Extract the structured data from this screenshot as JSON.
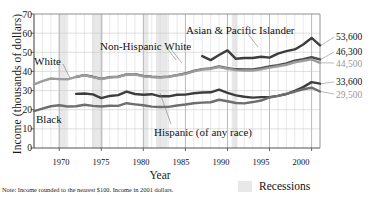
{
  "chart_data": {
    "type": "line",
    "title": "",
    "xlabel": "Year",
    "ylabel": "Income (thousands of dollars)",
    "xlim": [
      1967,
      2001
    ],
    "ylim": [
      0,
      70
    ],
    "yticks": [
      0,
      10,
      20,
      30,
      40,
      50,
      60,
      70
    ],
    "xticks": [
      1970,
      1975,
      1980,
      1985,
      1990,
      1995,
      2000
    ],
    "grid": "vertical-yearly-and-horizontal",
    "legend_position": "inline-annotations",
    "note": "Note: Income rounded to the nearest $100. Income in 2001 dollars.",
    "recession_legend_label": "Recessions",
    "recession_bands": [
      [
        1969.9,
        1970.9
      ],
      [
        1973.9,
        1975.2
      ],
      [
        1980.0,
        1980.6
      ],
      [
        1981.5,
        1982.9
      ],
      [
        1990.5,
        1991.2
      ],
      [
        2001.2,
        2001.9
      ]
    ],
    "series": [
      {
        "name": "Asian & Pacific Islander",
        "color": "#3d3d3d",
        "width": 2.4,
        "end_value_label": "53,600",
        "end_value": 53.6,
        "x": [
          1987,
          1988,
          1989,
          1990,
          1991,
          1992,
          1993,
          1994,
          1995,
          1996,
          1997,
          1998,
          1999,
          2000,
          2001
        ],
        "y": [
          48.0,
          45.9,
          48.6,
          51.0,
          46.6,
          47.0,
          47.0,
          47.7,
          47.2,
          49.3,
          50.6,
          51.5,
          54.1,
          57.5,
          53.6
        ]
      },
      {
        "name": "Non-Hispanic White",
        "color": "#4a4a4a",
        "width": 2.4,
        "end_value_label": "46,300",
        "end_value": 46.3,
        "x": [
          1972,
          1973,
          1974,
          1975,
          1976,
          1977,
          1978,
          1979,
          1980,
          1981,
          1982,
          1983,
          1984,
          1985,
          1986,
          1987,
          1988,
          1989,
          1990,
          1991,
          1992,
          1993,
          1994,
          1995,
          1996,
          1997,
          1998,
          1999,
          2000,
          2001
        ],
        "y": [
          37.1,
          38.1,
          37.2,
          36.1,
          37.0,
          37.3,
          38.4,
          38.6,
          37.6,
          37.2,
          37.0,
          37.3,
          38.1,
          38.9,
          40.3,
          41.2,
          41.6,
          42.6,
          41.7,
          41.1,
          41.0,
          41.0,
          41.7,
          42.6,
          43.3,
          44.2,
          45.6,
          46.4,
          47.4,
          46.3
        ]
      },
      {
        "name": "White",
        "color": "#9c9c9c",
        "width": 2.4,
        "end_value_label": "44,500",
        "end_value": 44.5,
        "x": [
          1967,
          1968,
          1969,
          1970,
          1971,
          1972,
          1973,
          1974,
          1975,
          1976,
          1977,
          1978,
          1979,
          1980,
          1981,
          1982,
          1983,
          1984,
          1985,
          1986,
          1987,
          1988,
          1989,
          1990,
          1991,
          1992,
          1993,
          1994,
          1995,
          1996,
          1997,
          1998,
          1999,
          2000,
          2001
        ],
        "y": [
          33.2,
          34.9,
          36.3,
          36.0,
          35.9,
          37.2,
          38.0,
          37.0,
          36.0,
          36.8,
          37.1,
          38.4,
          38.5,
          37.5,
          37.1,
          36.8,
          37.2,
          38.0,
          38.7,
          40.0,
          41.0,
          41.3,
          42.3,
          41.4,
          40.7,
          40.5,
          40.5,
          41.1,
          42.0,
          42.7,
          43.5,
          44.8,
          45.6,
          46.3,
          44.5
        ]
      },
      {
        "name": "Hispanic (of any race)",
        "color": "#3d3d3d",
        "width": 2.4,
        "end_value_label": "33,600",
        "end_value": 33.6,
        "x": [
          1972,
          1973,
          1974,
          1975,
          1976,
          1977,
          1978,
          1979,
          1980,
          1981,
          1982,
          1983,
          1984,
          1985,
          1986,
          1987,
          1988,
          1989,
          1990,
          1991,
          1992,
          1993,
          1994,
          1995,
          1996,
          1997,
          1998,
          1999,
          2000,
          2001
        ],
        "y": [
          28.3,
          28.5,
          28.0,
          26.1,
          27.2,
          27.6,
          29.5,
          28.2,
          27.8,
          28.1,
          27.0,
          27.0,
          27.8,
          27.9,
          28.6,
          29.0,
          29.1,
          30.5,
          28.8,
          27.5,
          26.8,
          26.3,
          26.6,
          26.6,
          27.2,
          28.2,
          29.8,
          31.8,
          34.4,
          33.6
        ]
      },
      {
        "name": "Black",
        "color": "#6e6e6e",
        "width": 2.4,
        "end_value_label": "29,500",
        "end_value": 29.5,
        "x": [
          1967,
          1968,
          1969,
          1970,
          1971,
          1972,
          1973,
          1974,
          1975,
          1976,
          1977,
          1978,
          1979,
          1980,
          1981,
          1982,
          1983,
          1984,
          1985,
          1986,
          1987,
          1988,
          1989,
          1990,
          1991,
          1992,
          1993,
          1994,
          1995,
          1996,
          1997,
          1998,
          1999,
          2000,
          2001
        ],
        "y": [
          19.3,
          20.6,
          21.8,
          22.3,
          21.7,
          21.8,
          22.6,
          22.0,
          21.7,
          22.1,
          22.0,
          23.4,
          22.8,
          22.3,
          21.6,
          21.4,
          21.5,
          22.2,
          22.7,
          23.4,
          23.7,
          23.9,
          25.2,
          24.4,
          23.5,
          23.3,
          24.0,
          24.8,
          26.4,
          27.2,
          28.3,
          29.4,
          30.7,
          31.5,
          29.5
        ]
      }
    ],
    "annotations": [
      {
        "text": "White",
        "role": "series-label"
      },
      {
        "text": "Black",
        "role": "series-label"
      },
      {
        "text": "Non-Hispanic White",
        "role": "series-label"
      },
      {
        "text": "Asian & Pacific Islander",
        "role": "series-label"
      },
      {
        "text": "Hispanic (of any race)",
        "role": "series-label"
      }
    ]
  },
  "axis": {
    "y_title": "Income (thousands of dollars)",
    "x_title": "Year",
    "yticks": [
      "70",
      "60",
      "50",
      "40",
      "30",
      "20",
      "10",
      "0"
    ],
    "xticks": [
      "1970",
      "1975",
      "1980",
      "1985",
      "1990",
      "1995",
      "2000"
    ]
  },
  "labels": {
    "white": "White",
    "black": "Black",
    "non_hispanic_white": "Non-Hispanic White",
    "asian_pacific": "Asian & Pacific Islander",
    "hispanic": "Hispanic (of any race)"
  },
  "end_values": {
    "asian": "53,600",
    "nhwhite": "46,300",
    "white": "44,500",
    "hispanic": "33,600",
    "black": "29,500"
  },
  "footer": {
    "note": "Note: Income rounded to the nearest $100. Income in 2001 dollars.",
    "recessions_label": "Recessions"
  },
  "colors": {
    "axis": "#555555",
    "grid": "#cfcfcf",
    "recession_band": "#e8e8e8",
    "dark_series": "#3d3d3d",
    "mid_series": "#6e6e6e",
    "light_series": "#9c9c9c"
  }
}
